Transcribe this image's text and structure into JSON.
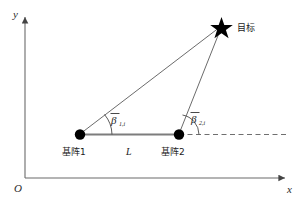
{
  "figure": {
    "kind": "geometry-diagram",
    "background_color": "#ffffff",
    "line_color": "#555555",
    "marker_color": "#000000"
  },
  "axes": {
    "origin_label": "O",
    "x_label": "x",
    "y_label": "y"
  },
  "nodes": {
    "array1": {
      "label": "基阵1",
      "marker": "filled-circle-marker"
    },
    "array2": {
      "label": "基阵2",
      "marker": "filled-circle-marker"
    },
    "target": {
      "label": "目标",
      "marker": "star-marker"
    }
  },
  "measurements": {
    "baseline_label": "L",
    "angle1": {
      "symbol": "β",
      "subscript": "1,i",
      "overbar": true
    },
    "angle2": {
      "symbol": "β",
      "subscript": "2,i",
      "overbar": true
    }
  }
}
